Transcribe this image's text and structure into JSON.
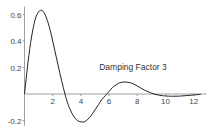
{
  "chart_data": {
    "type": "line",
    "title": "",
    "xlabel": "",
    "ylabel": "",
    "xlim": [
      0,
      12.9
    ],
    "ylim": [
      -0.24,
      0.66
    ],
    "grid": false,
    "legend": null,
    "annotations": [
      {
        "text": "Damping Factor 3",
        "x": 5.3,
        "y": 0.2
      }
    ],
    "x_ticks": [
      2,
      4,
      6,
      8,
      10,
      12
    ],
    "x_tick_labels": [
      "2",
      "4",
      "6",
      "8",
      "10",
      "12"
    ],
    "y_ticks": [
      -0.2,
      0.2,
      0.4,
      0.6
    ],
    "y_tick_labels": [
      "-0.2",
      "0.2",
      "0.4",
      "0.6"
    ],
    "series": [
      {
        "name": "Damping Factor 3",
        "x": [
          0,
          0.25,
          0.5,
          0.75,
          1.0,
          1.25,
          1.5,
          1.75,
          2.0,
          2.25,
          2.5,
          2.75,
          3.0,
          3.25,
          3.5,
          3.75,
          4.0,
          4.25,
          4.5,
          4.75,
          5.0,
          5.25,
          5.5,
          5.75,
          6.0,
          6.25,
          6.5,
          6.75,
          7.0,
          7.25,
          7.5,
          7.75,
          8.0,
          8.25,
          8.5,
          8.75,
          9.0,
          9.25,
          9.5,
          9.75,
          10.0,
          10.5,
          11.0,
          11.5,
          12.0,
          12.5
        ],
        "y": [
          0,
          0.24,
          0.43,
          0.56,
          0.62,
          0.63,
          0.59,
          0.51,
          0.4,
          0.28,
          0.16,
          0.05,
          -0.05,
          -0.12,
          -0.17,
          -0.2,
          -0.21,
          -0.21,
          -0.19,
          -0.16,
          -0.12,
          -0.08,
          -0.04,
          -0.01,
          0.02,
          0.05,
          0.07,
          0.085,
          0.09,
          0.09,
          0.085,
          0.075,
          0.06,
          0.045,
          0.03,
          0.018,
          0.007,
          -0.002,
          -0.008,
          -0.012,
          -0.015,
          -0.017,
          -0.016,
          -0.012,
          -0.007,
          -0.003
        ]
      }
    ]
  }
}
